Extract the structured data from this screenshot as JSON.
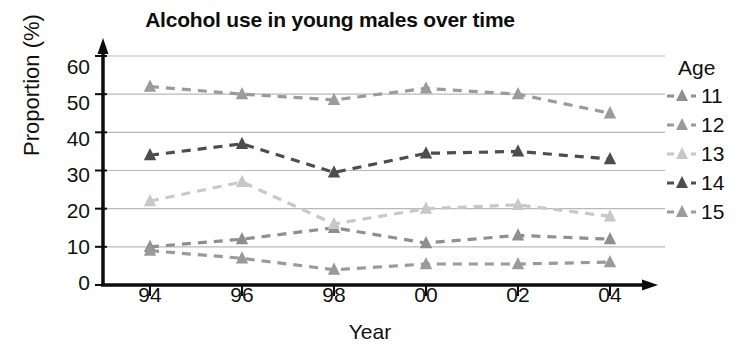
{
  "chart_data": {
    "type": "line",
    "title": "Alcohol use in young males over time",
    "xlabel": "Year",
    "ylabel": "Proportion (%)",
    "categories": [
      "94",
      "96",
      "98",
      "00",
      "02",
      "04"
    ],
    "ylim": [
      0,
      60
    ],
    "yticks": [
      "0",
      "10",
      "20",
      "30",
      "40",
      "50",
      "60"
    ],
    "grid": "horizontal",
    "legend_position": "right",
    "legend_title": "Age",
    "series": [
      {
        "name": "11",
        "values": [
          10,
          12,
          15,
          11,
          13,
          12
        ],
        "color": "#8f8f8f"
      },
      {
        "name": "12",
        "values": [
          9,
          7,
          4,
          5.5,
          5.5,
          6
        ],
        "color": "#9a9a9a"
      },
      {
        "name": "13",
        "values": [
          22,
          27,
          16,
          20,
          21,
          18
        ],
        "color": "#c8c8c8"
      },
      {
        "name": "14",
        "values": [
          34,
          37,
          29.5,
          34.5,
          35,
          33
        ],
        "color": "#4d4d4d"
      },
      {
        "name": "15",
        "values": [
          52,
          50,
          48.5,
          51.5,
          50,
          45
        ],
        "color": "#9b9b9b"
      }
    ]
  }
}
